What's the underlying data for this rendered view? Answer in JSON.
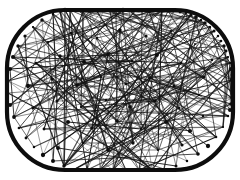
{
  "figure": {
    "title": "Chord mesh inside stadium outline",
    "type": "abstract-line-graphic",
    "width": 240,
    "height": 180,
    "background_color": "#ffffff",
    "ink_color": "#111111"
  },
  "chart_data": {
    "type": "scatter",
    "title": "Chord mesh inside stadium outline",
    "subtitle": "",
    "xlabel": "",
    "ylabel": "",
    "xlim": [
      0,
      240
    ],
    "ylim": [
      0,
      180
    ],
    "grid": false,
    "legend_position": "none",
    "tick_labels_x": [],
    "tick_labels_y": [],
    "annotations": [],
    "boundary": {
      "shape": "stadium",
      "left": 7,
      "top": 10,
      "right": 233,
      "bottom": 170,
      "corner_radius": 58,
      "stroke_width": 4.2,
      "stroke_color": "#0d0d0d"
    },
    "edge_style": {
      "stroke_color": "#141414",
      "stroke_width_min": 0.45,
      "stroke_width_max": 1.25,
      "opacity_min": 0.55,
      "opacity_max": 1.0
    },
    "node_style": {
      "fill_color": "#0d0d0d",
      "radius_min": 0.9,
      "radius_max": 2.2
    },
    "counts": {
      "perimeter_nodes": 72,
      "interior_nodes": 46,
      "chords": 268
    },
    "perimeter_nodes": [
      [
        65,
        10
      ],
      [
        78,
        10
      ],
      [
        90,
        11
      ],
      [
        103,
        10
      ],
      [
        116,
        11
      ],
      [
        129,
        10
      ],
      [
        142,
        11
      ],
      [
        155,
        10
      ],
      [
        168,
        11
      ],
      [
        180,
        12
      ],
      [
        191,
        15
      ],
      [
        201,
        20
      ],
      [
        210,
        27
      ],
      [
        218,
        36
      ],
      [
        224,
        46
      ],
      [
        228,
        57
      ],
      [
        231,
        69
      ],
      [
        232,
        80
      ],
      [
        232,
        92
      ],
      [
        231,
        104
      ],
      [
        228,
        116
      ],
      [
        223,
        127
      ],
      [
        216,
        137
      ],
      [
        208,
        146
      ],
      [
        198,
        154
      ],
      [
        187,
        161
      ],
      [
        176,
        166
      ],
      [
        164,
        169
      ],
      [
        152,
        170
      ],
      [
        139,
        170
      ],
      [
        126,
        170
      ],
      [
        113,
        170
      ],
      [
        100,
        170
      ],
      [
        87,
        170
      ],
      [
        75,
        169
      ],
      [
        64,
        166
      ],
      [
        53,
        161
      ],
      [
        43,
        155
      ],
      [
        34,
        147
      ],
      [
        26,
        138
      ],
      [
        19,
        128
      ],
      [
        14,
        117
      ],
      [
        10,
        105
      ],
      [
        8,
        93
      ],
      [
        8,
        81
      ],
      [
        10,
        69
      ],
      [
        13,
        57
      ],
      [
        18,
        46
      ],
      [
        25,
        36
      ],
      [
        33,
        27
      ],
      [
        42,
        20
      ],
      [
        53,
        14
      ],
      [
        60,
        11
      ],
      [
        70,
        10
      ],
      [
        83,
        11
      ],
      [
        96,
        10
      ],
      [
        110,
        11
      ],
      [
        123,
        10
      ],
      [
        136,
        10
      ],
      [
        149,
        11
      ],
      [
        162,
        10
      ],
      [
        174,
        11
      ],
      [
        186,
        13
      ],
      [
        196,
        17
      ],
      [
        205,
        23
      ],
      [
        214,
        31
      ],
      [
        221,
        41
      ],
      [
        226,
        51
      ],
      [
        230,
        63
      ],
      [
        232,
        75
      ],
      [
        232,
        98
      ],
      [
        230,
        110
      ]
    ],
    "interior_nodes": [
      [
        48,
        42
      ],
      [
        71,
        33
      ],
      [
        97,
        38
      ],
      [
        120,
        30
      ],
      [
        146,
        36
      ],
      [
        171,
        31
      ],
      [
        195,
        44
      ],
      [
        212,
        60
      ],
      [
        36,
        63
      ],
      [
        60,
        56
      ],
      [
        84,
        62
      ],
      [
        108,
        54
      ],
      [
        132,
        61
      ],
      [
        157,
        55
      ],
      [
        181,
        63
      ],
      [
        204,
        77
      ],
      [
        28,
        86
      ],
      [
        52,
        79
      ],
      [
        77,
        85
      ],
      [
        101,
        77
      ],
      [
        126,
        84
      ],
      [
        150,
        78
      ],
      [
        174,
        86
      ],
      [
        199,
        95
      ],
      [
        33,
        108
      ],
      [
        57,
        101
      ],
      [
        81,
        107
      ],
      [
        106,
        100
      ],
      [
        130,
        107
      ],
      [
        155,
        101
      ],
      [
        179,
        108
      ],
      [
        203,
        116
      ],
      [
        44,
        129
      ],
      [
        68,
        122
      ],
      [
        92,
        128
      ],
      [
        117,
        121
      ],
      [
        141,
        129
      ],
      [
        166,
        122
      ],
      [
        190,
        131
      ],
      [
        58,
        148
      ],
      [
        83,
        143
      ],
      [
        108,
        150
      ],
      [
        133,
        143
      ],
      [
        158,
        150
      ],
      [
        182,
        145
      ],
      [
        120,
        90
      ]
    ],
    "values": [],
    "categories": []
  }
}
